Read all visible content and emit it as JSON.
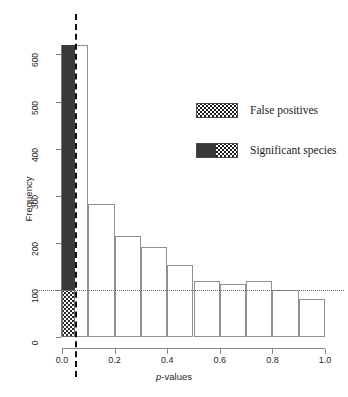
{
  "chart_data": {
    "type": "bar",
    "title": "",
    "subtitle": "",
    "xlabel": "p-values",
    "xlabel_prefix_italic": "p",
    "xlabel_suffix": "-values",
    "ylabel": "Frequency",
    "xlim": [
      0.0,
      1.0
    ],
    "ylim": [
      0,
      620
    ],
    "grid": false,
    "bin_width": 0.1,
    "categories": [
      "0.0-0.1",
      "0.1-0.2",
      "0.2-0.3",
      "0.3-0.4",
      "0.4-0.5",
      "0.5-0.6",
      "0.6-0.7",
      "0.7-0.8",
      "0.8-0.9",
      "0.9-1.0"
    ],
    "bin_starts": [
      0.0,
      0.1,
      0.2,
      0.3,
      0.4,
      0.5,
      0.6,
      0.7,
      0.8,
      0.9
    ],
    "values": [
      620,
      283,
      214,
      192,
      152,
      118,
      112,
      118,
      100,
      80
    ],
    "xticks": [
      "0.0",
      "0.2",
      "0.4",
      "0.6",
      "0.8",
      "1.0"
    ],
    "xtick_values": [
      0.0,
      0.2,
      0.4,
      0.6,
      0.8,
      1.0
    ],
    "yticks": [
      "0",
      "100",
      "200",
      "300",
      "400",
      "500",
      "600"
    ],
    "ytick_values": [
      0,
      100,
      200,
      300,
      400,
      500,
      600
    ],
    "annotations": {
      "hline_100": {
        "y": 100,
        "style": "dotted",
        "color": "#6b6b6b"
      },
      "vline_threshold": {
        "x": 0.05,
        "style": "dashed",
        "color": "#111111"
      }
    },
    "overlay_series": [
      {
        "name": "Significant species",
        "fill": "solid-dark",
        "color": "#3a3a3a",
        "x_from": 0.0,
        "x_to": 0.05,
        "y_from": 100,
        "y_to": 620
      },
      {
        "name": "False positives",
        "fill": "stipple",
        "color": "#262626",
        "x_from": 0.0,
        "x_to": 0.05,
        "y_from": 0,
        "y_to": 100
      }
    ],
    "legend": {
      "position": "top-right",
      "entries": [
        {
          "label": "False positives",
          "swatch": "stipple"
        },
        {
          "label": "Significant species",
          "swatch": "dark-and-stipple"
        }
      ]
    }
  },
  "colors": {
    "bar_outline": "#909090",
    "bar_fill": "#ffffff",
    "significant_fill": "#3a3a3a",
    "stipple_dot": "#262626",
    "axis": "#7a7a7a",
    "reference_line": "#6b6b6b",
    "threshold_line": "#111111",
    "text": "#1a1a1a"
  }
}
